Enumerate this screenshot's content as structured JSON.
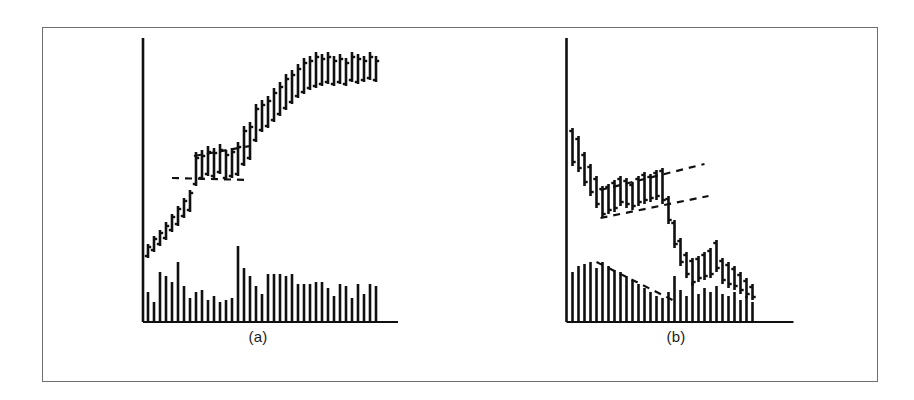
{
  "figure": {
    "background_color": "#ffffff",
    "border_color": "#6e6e72",
    "ink_color": "#101010",
    "panels": [
      {
        "key": "a",
        "caption": "(a)"
      },
      {
        "key": "b",
        "caption": "(b)"
      }
    ]
  },
  "chart_data": [
    {
      "type": "bar",
      "panel": "a",
      "title": "(a)",
      "subtitle": "Uptrend with flag consolidation",
      "xlabel": "",
      "ylabel": "",
      "grid": false,
      "legend": "none",
      "axis": {
        "x_axis_y": 322,
        "y_axis_x": 185,
        "x_axis_x0": 185,
        "x_axis_x1": 440,
        "y_axis_y_top": 38,
        "y_axis_y_bottom": 322
      },
      "price_series_name": "OHLC price bars",
      "price_note": "Each element is a vertical high-low bar with a left tick (open) and right tick (close).",
      "price_bars": [
        {
          "x": 190,
          "high": 244,
          "low": 258,
          "open": 256,
          "close": 247
        },
        {
          "x": 196,
          "high": 236,
          "low": 252,
          "open": 250,
          "close": 239
        },
        {
          "x": 202,
          "high": 230,
          "low": 246,
          "open": 244,
          "close": 233
        },
        {
          "x": 208,
          "high": 222,
          "low": 240,
          "open": 238,
          "close": 226
        },
        {
          "x": 214,
          "high": 214,
          "low": 232,
          "open": 230,
          "close": 217
        },
        {
          "x": 220,
          "high": 206,
          "low": 226,
          "open": 224,
          "close": 209
        },
        {
          "x": 226,
          "high": 198,
          "low": 218,
          "open": 216,
          "close": 201
        },
        {
          "x": 232,
          "high": 190,
          "low": 212,
          "open": 210,
          "close": 193
        },
        {
          "x": 238,
          "high": 152,
          "low": 186,
          "open": 184,
          "close": 158
        },
        {
          "x": 244,
          "high": 150,
          "low": 180,
          "open": 178,
          "close": 156
        },
        {
          "x": 250,
          "high": 146,
          "low": 176,
          "open": 174,
          "close": 152
        },
        {
          "x": 256,
          "high": 148,
          "low": 178,
          "open": 176,
          "close": 153
        },
        {
          "x": 262,
          "high": 144,
          "low": 174,
          "open": 172,
          "close": 150
        },
        {
          "x": 268,
          "high": 150,
          "low": 180,
          "open": 178,
          "close": 155
        },
        {
          "x": 274,
          "high": 148,
          "low": 178,
          "open": 176,
          "close": 152
        },
        {
          "x": 280,
          "high": 142,
          "low": 176,
          "open": 174,
          "close": 147
        },
        {
          "x": 286,
          "high": 126,
          "low": 166,
          "open": 164,
          "close": 131
        },
        {
          "x": 292,
          "high": 122,
          "low": 160,
          "open": 158,
          "close": 127
        },
        {
          "x": 298,
          "high": 104,
          "low": 142,
          "open": 140,
          "close": 109
        },
        {
          "x": 304,
          "high": 100,
          "low": 132,
          "open": 130,
          "close": 105
        },
        {
          "x": 310,
          "high": 96,
          "low": 128,
          "open": 126,
          "close": 101
        },
        {
          "x": 316,
          "high": 88,
          "low": 122,
          "open": 120,
          "close": 93
        },
        {
          "x": 322,
          "high": 82,
          "low": 116,
          "open": 114,
          "close": 87
        },
        {
          "x": 328,
          "high": 74,
          "low": 110,
          "open": 108,
          "close": 79
        },
        {
          "x": 334,
          "high": 70,
          "low": 104,
          "open": 102,
          "close": 75
        },
        {
          "x": 340,
          "high": 64,
          "low": 98,
          "open": 96,
          "close": 69
        },
        {
          "x": 346,
          "high": 58,
          "low": 94,
          "open": 92,
          "close": 63
        },
        {
          "x": 352,
          "high": 56,
          "low": 90,
          "open": 88,
          "close": 61
        },
        {
          "x": 358,
          "high": 52,
          "low": 88,
          "open": 86,
          "close": 57
        },
        {
          "x": 364,
          "high": 54,
          "low": 86,
          "open": 84,
          "close": 59
        },
        {
          "x": 370,
          "high": 52,
          "low": 84,
          "open": 82,
          "close": 57
        },
        {
          "x": 376,
          "high": 56,
          "low": 86,
          "open": 84,
          "close": 61
        },
        {
          "x": 382,
          "high": 54,
          "low": 84,
          "open": 82,
          "close": 59
        },
        {
          "x": 388,
          "high": 58,
          "low": 86,
          "open": 84,
          "close": 63
        },
        {
          "x": 394,
          "high": 52,
          "low": 82,
          "open": 80,
          "close": 57
        },
        {
          "x": 400,
          "high": 54,
          "low": 84,
          "open": 82,
          "close": 59
        },
        {
          "x": 406,
          "high": 56,
          "low": 82,
          "open": 80,
          "close": 61
        },
        {
          "x": 412,
          "high": 52,
          "low": 80,
          "open": 78,
          "close": 57
        },
        {
          "x": 418,
          "high": 56,
          "low": 82,
          "open": 80,
          "close": 61
        }
      ],
      "volume_series_name": "Volume",
      "volume_baseline_y": 322,
      "volume_bars": [
        {
          "x": 190,
          "top": 292
        },
        {
          "x": 196,
          "top": 302
        },
        {
          "x": 202,
          "top": 272
        },
        {
          "x": 208,
          "top": 276
        },
        {
          "x": 214,
          "top": 282
        },
        {
          "x": 220,
          "top": 262
        },
        {
          "x": 226,
          "top": 286
        },
        {
          "x": 232,
          "top": 298
        },
        {
          "x": 238,
          "top": 292
        },
        {
          "x": 244,
          "top": 290
        },
        {
          "x": 250,
          "top": 300
        },
        {
          "x": 256,
          "top": 296
        },
        {
          "x": 262,
          "top": 302
        },
        {
          "x": 268,
          "top": 300
        },
        {
          "x": 274,
          "top": 298
        },
        {
          "x": 280,
          "top": 246
        },
        {
          "x": 286,
          "top": 268
        },
        {
          "x": 292,
          "top": 276
        },
        {
          "x": 298,
          "top": 286
        },
        {
          "x": 304,
          "top": 294
        },
        {
          "x": 310,
          "top": 274
        },
        {
          "x": 316,
          "top": 274
        },
        {
          "x": 322,
          "top": 274
        },
        {
          "x": 328,
          "top": 276
        },
        {
          "x": 334,
          "top": 274
        },
        {
          "x": 340,
          "top": 284
        },
        {
          "x": 346,
          "top": 284
        },
        {
          "x": 352,
          "top": 284
        },
        {
          "x": 358,
          "top": 282
        },
        {
          "x": 364,
          "top": 282
        },
        {
          "x": 370,
          "top": 288
        },
        {
          "x": 376,
          "top": 296
        },
        {
          "x": 382,
          "top": 284
        },
        {
          "x": 388,
          "top": 286
        },
        {
          "x": 394,
          "top": 298
        },
        {
          "x": 400,
          "top": 284
        },
        {
          "x": 406,
          "top": 294
        },
        {
          "x": 412,
          "top": 284
        },
        {
          "x": 418,
          "top": 286
        }
      ],
      "trendlines": [
        {
          "name": "flag-upper-boundary",
          "style": "dashed",
          "x1": 236,
          "y1": 156,
          "x2": 292,
          "y2": 146
        },
        {
          "name": "flag-lower-boundary",
          "style": "dashed",
          "x1": 214,
          "y1": 178,
          "x2": 292,
          "y2": 180
        }
      ]
    },
    {
      "type": "bar",
      "panel": "b",
      "title": "(b)",
      "subtitle": "Downtrend with flag consolidation",
      "xlabel": "",
      "ylabel": "",
      "grid": false,
      "legend": "none",
      "axis": {
        "x_axis_y": 322,
        "y_axis_x": 518,
        "x_axis_x0": 518,
        "x_axis_x1": 745,
        "y_axis_y_top": 38,
        "y_axis_y_bottom": 322
      },
      "price_series_name": "OHLC price bars",
      "price_note": "Each element is a vertical high-low bar with a left tick (open) and right tick (close).",
      "price_bars": [
        {
          "x": 524,
          "high": 128,
          "low": 166,
          "open": 131,
          "close": 162
        },
        {
          "x": 530,
          "high": 136,
          "low": 172,
          "open": 139,
          "close": 168
        },
        {
          "x": 536,
          "high": 152,
          "low": 186,
          "open": 155,
          "close": 182
        },
        {
          "x": 542,
          "high": 164,
          "low": 196,
          "open": 167,
          "close": 192
        },
        {
          "x": 548,
          "high": 176,
          "low": 208,
          "open": 179,
          "close": 204
        },
        {
          "x": 554,
          "high": 186,
          "low": 218,
          "open": 189,
          "close": 214
        },
        {
          "x": 560,
          "high": 184,
          "low": 214,
          "open": 187,
          "close": 210
        },
        {
          "x": 566,
          "high": 180,
          "low": 212,
          "open": 183,
          "close": 208
        },
        {
          "x": 572,
          "high": 176,
          "low": 206,
          "open": 179,
          "close": 202
        },
        {
          "x": 578,
          "high": 178,
          "low": 208,
          "open": 181,
          "close": 204
        },
        {
          "x": 584,
          "high": 182,
          "low": 210,
          "open": 185,
          "close": 206
        },
        {
          "x": 590,
          "high": 176,
          "low": 206,
          "open": 179,
          "close": 202
        },
        {
          "x": 596,
          "high": 172,
          "low": 204,
          "open": 175,
          "close": 200
        },
        {
          "x": 602,
          "high": 174,
          "low": 202,
          "open": 177,
          "close": 198
        },
        {
          "x": 608,
          "high": 170,
          "low": 200,
          "open": 173,
          "close": 196
        },
        {
          "x": 614,
          "high": 168,
          "low": 204,
          "open": 171,
          "close": 200
        },
        {
          "x": 620,
          "high": 196,
          "low": 224,
          "open": 199,
          "close": 220
        },
        {
          "x": 626,
          "high": 220,
          "low": 248,
          "open": 223,
          "close": 244
        },
        {
          "x": 632,
          "high": 238,
          "low": 266,
          "open": 241,
          "close": 262
        },
        {
          "x": 638,
          "high": 252,
          "low": 278,
          "open": 255,
          "close": 274
        },
        {
          "x": 644,
          "high": 258,
          "low": 286,
          "open": 261,
          "close": 282
        },
        {
          "x": 650,
          "high": 256,
          "low": 282,
          "open": 259,
          "close": 278
        },
        {
          "x": 656,
          "high": 252,
          "low": 280,
          "open": 255,
          "close": 276
        },
        {
          "x": 662,
          "high": 248,
          "low": 278,
          "open": 251,
          "close": 274
        },
        {
          "x": 668,
          "high": 240,
          "low": 272,
          "open": 243,
          "close": 268
        },
        {
          "x": 674,
          "high": 258,
          "low": 284,
          "open": 261,
          "close": 280
        },
        {
          "x": 680,
          "high": 262,
          "low": 288,
          "open": 265,
          "close": 284
        },
        {
          "x": 686,
          "high": 266,
          "low": 290,
          "open": 269,
          "close": 286
        },
        {
          "x": 692,
          "high": 272,
          "low": 294,
          "open": 275,
          "close": 290
        },
        {
          "x": 698,
          "high": 278,
          "low": 298,
          "open": 281,
          "close": 294
        },
        {
          "x": 704,
          "high": 284,
          "low": 300,
          "open": 287,
          "close": 297
        }
      ],
      "volume_series_name": "Volume",
      "volume_baseline_y": 322,
      "volume_bars": [
        {
          "x": 524,
          "top": 272
        },
        {
          "x": 530,
          "top": 266
        },
        {
          "x": 536,
          "top": 264
        },
        {
          "x": 542,
          "top": 262
        },
        {
          "x": 548,
          "top": 268
        },
        {
          "x": 554,
          "top": 262
        },
        {
          "x": 560,
          "top": 266
        },
        {
          "x": 566,
          "top": 270
        },
        {
          "x": 572,
          "top": 272
        },
        {
          "x": 578,
          "top": 276
        },
        {
          "x": 584,
          "top": 280
        },
        {
          "x": 590,
          "top": 284
        },
        {
          "x": 596,
          "top": 288
        },
        {
          "x": 602,
          "top": 292
        },
        {
          "x": 608,
          "top": 296
        },
        {
          "x": 614,
          "top": 298
        },
        {
          "x": 620,
          "top": 292
        },
        {
          "x": 626,
          "top": 276
        },
        {
          "x": 632,
          "top": 290
        },
        {
          "x": 638,
          "top": 296
        },
        {
          "x": 644,
          "top": 282
        },
        {
          "x": 650,
          "top": 294
        },
        {
          "x": 656,
          "top": 288
        },
        {
          "x": 662,
          "top": 292
        },
        {
          "x": 668,
          "top": 286
        },
        {
          "x": 674,
          "top": 294
        },
        {
          "x": 680,
          "top": 296
        },
        {
          "x": 686,
          "top": 292
        },
        {
          "x": 692,
          "top": 300
        },
        {
          "x": 698,
          "top": 296
        },
        {
          "x": 704,
          "top": 302
        }
      ],
      "trendlines": [
        {
          "name": "flag-upper-boundary",
          "style": "dashed",
          "x1": 552,
          "y1": 190,
          "x2": 656,
          "y2": 164
        },
        {
          "name": "flag-lower-boundary",
          "style": "dashed",
          "x1": 552,
          "y1": 218,
          "x2": 660,
          "y2": 196
        },
        {
          "name": "volume-downtrend-line",
          "style": "dashed",
          "x1": 548,
          "y1": 262,
          "x2": 624,
          "y2": 300
        }
      ]
    }
  ]
}
